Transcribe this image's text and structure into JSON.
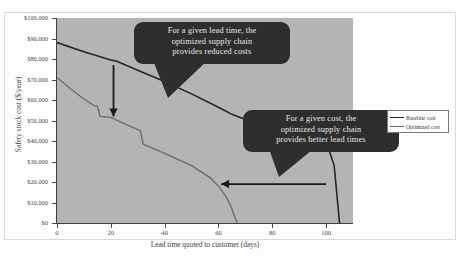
{
  "chart_data": {
    "type": "line",
    "title": "",
    "xlabel": "Lead time quoted to customer (days)",
    "ylabel": "Safety stock cost ($/year)",
    "xlim": [
      0,
      110
    ],
    "ylim": [
      0,
      100000
    ],
    "grid": false,
    "legend_position": "right",
    "xticks": [
      "0",
      "20",
      "40",
      "60",
      "80",
      "100"
    ],
    "xtick_values": [
      0,
      20,
      40,
      60,
      80,
      100
    ],
    "yticks": [
      "$0",
      "$10,000",
      "$20,000",
      "$30,000",
      "$40,000",
      "$50,000",
      "$60,000",
      "$70,000",
      "$80,000",
      "$90,000",
      "$100,000"
    ],
    "ytick_values": [
      0,
      10000,
      20000,
      30000,
      40000,
      50000,
      60000,
      70000,
      80000,
      90000,
      100000
    ],
    "series": [
      {
        "name": "Baseline cost",
        "color": "#252525",
        "x": [
          0,
          10,
          20,
          22,
          30,
          40,
          50,
          60,
          65,
          70,
          80,
          90,
          97,
          101,
          103,
          104,
          105
        ],
        "y": [
          88000,
          83500,
          79500,
          79000,
          74500,
          69000,
          63000,
          56500,
          53000,
          50500,
          45500,
          42000,
          39500,
          36000,
          28000,
          14000,
          0
        ]
      },
      {
        "name": "Optimized cost",
        "color": "#6b6b6b",
        "x": [
          0,
          5,
          10,
          14,
          15,
          16,
          20,
          25,
          30,
          31,
          32,
          40,
          50,
          57,
          60,
          63,
          65,
          66,
          67
        ],
        "y": [
          71000,
          65500,
          60500,
          57000,
          57000,
          52000,
          51500,
          48500,
          45500,
          45000,
          38500,
          34000,
          28000,
          22000,
          18000,
          12500,
          7000,
          3000,
          0
        ]
      }
    ],
    "annotations": [
      {
        "id": "callout-lead-time",
        "text": "For a given lead time, the optimized supply chain provides reduced costs",
        "lines": [
          "For a given lead time, the",
          "optimized supply chain",
          "provides reduced costs"
        ],
        "arrow_from": [
          21,
          77000
        ],
        "arrow_to": [
          21,
          52000
        ]
      },
      {
        "id": "callout-cost",
        "text": "For a given cost, the optimized supply chain provides better lead times",
        "lines": [
          "For a given cost, the",
          "optimized supply chain",
          "provides better lead times"
        ],
        "arrow_from": [
          100,
          19000
        ],
        "arrow_to": [
          61,
          19000
        ]
      }
    ]
  },
  "legend": {
    "items": [
      {
        "label": "Baseline cost"
      },
      {
        "label": "Optimized cost"
      }
    ]
  },
  "axes": {
    "x_title": "Lead time quoted to customer (days)",
    "y_title": "Safety stock cost ($/year)"
  }
}
